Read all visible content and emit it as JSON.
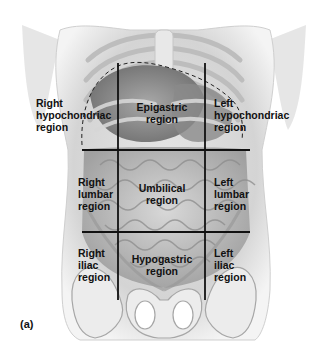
{
  "figure": {
    "panel_letter": "(a)",
    "colors": {
      "grid_line": "#111111",
      "label_text": "#111111",
      "body_light": "#f2f2f2",
      "body_mid": "#c8c8c8",
      "body_dark": "#7a7a7a",
      "background": "#ffffff"
    },
    "grid": {
      "vertical_lines_x": [
        118,
        205
      ],
      "horizontal_lines_y": [
        150,
        232
      ],
      "vertical_extent_y": [
        63,
        300
      ],
      "horizontal_extent_x": [
        82,
        250
      ]
    },
    "regions": [
      {
        "id": "right-hypochondriac",
        "text": "Right\nhypochondriac\nregion",
        "row": 1,
        "col": 1
      },
      {
        "id": "epigastric",
        "text": "Epigastric\nregion",
        "row": 1,
        "col": 2
      },
      {
        "id": "left-hypochondriac",
        "text": "Left\nhypochondriac\nregion",
        "row": 1,
        "col": 3
      },
      {
        "id": "right-lumbar",
        "text": "Right\nlumbar\nregion",
        "row": 2,
        "col": 1
      },
      {
        "id": "umbilical",
        "text": "Umbilical\nregion",
        "row": 2,
        "col": 2
      },
      {
        "id": "left-lumbar",
        "text": "Left\nlumbar\nregion",
        "row": 2,
        "col": 3
      },
      {
        "id": "right-iliac",
        "text": "Right\niliac\nregion",
        "row": 3,
        "col": 1
      },
      {
        "id": "hypogastric",
        "text": "Hypogastric\nregion",
        "row": 3,
        "col": 2
      },
      {
        "id": "left-iliac",
        "text": "Left\niliac\nregion",
        "row": 3,
        "col": 3
      }
    ]
  }
}
